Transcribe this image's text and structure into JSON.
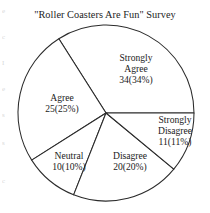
{
  "chart_data": {
    "type": "pie",
    "title": "\"Roller Coasters Are Fun\" Survey",
    "xlabel": "",
    "ylabel": "",
    "grid": false,
    "legend": "none",
    "labels_position": "inside-and-outside-slices",
    "total_count": 100,
    "categories": [
      "Strongly Agree",
      "Agree",
      "Neutral",
      "Disagree",
      "Strongly Disagree"
    ],
    "values": [
      34,
      25,
      10,
      20,
      11
    ],
    "percentages": [
      34,
      25,
      10,
      20,
      11
    ],
    "slices": [
      {
        "name": "Strongly Agree",
        "count": 34,
        "percent": 34,
        "label_line1": "Strongly",
        "label_line2": "Agree",
        "label_value": "34(34%)",
        "start_angle_deg": 0,
        "end_angle_deg": 122.4
      },
      {
        "name": "Agree",
        "count": 25,
        "percent": 25,
        "label_line1": "Agree",
        "label_line2": "",
        "label_value": "25(25%)",
        "start_angle_deg": 122.4,
        "end_angle_deg": 212.4
      },
      {
        "name": "Neutral",
        "count": 10,
        "percent": 10,
        "label_line1": "Neutral",
        "label_line2": "",
        "label_value": "10(10%)",
        "start_angle_deg": 212.4,
        "end_angle_deg": 248.4
      },
      {
        "name": "Disagree",
        "count": 20,
        "percent": 20,
        "label_line1": "Disagree",
        "label_line2": "",
        "label_value": "20(20%)",
        "start_angle_deg": 248.4,
        "end_angle_deg": 320.4
      },
      {
        "name": "Strongly Disagree",
        "count": 11,
        "percent": 11,
        "label_line1": "Strongly",
        "label_line2": "Disagree",
        "label_value": "11(11%)",
        "start_angle_deg": 320.4,
        "end_angle_deg": 360
      }
    ],
    "colors": {
      "slice_fill": "#ffffff",
      "slice_stroke": "#2b2b2b",
      "text": "#1c1c1c",
      "background": "#ffffff"
    },
    "geometry": {
      "center_x": 106,
      "center_y": 113,
      "radius": 88
    }
  },
  "scan_artifacts": [
    "e",
    "c",
    "I",
    "e",
    "s",
    "s",
    "c"
  ]
}
